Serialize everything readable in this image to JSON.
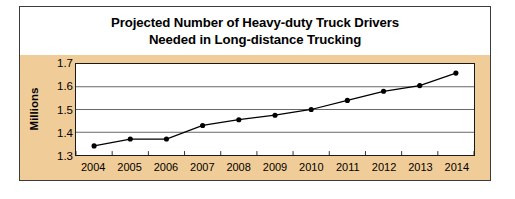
{
  "figure": {
    "title_lines": [
      "Projected Number of Heavy-duty Truck Drivers",
      "Needed in Long-distance Trucking"
    ],
    "background_color": "#f0cd98",
    "plot_background_color": "#ffffff",
    "border_color": "#3b3b3b",
    "line_color": "#000000",
    "marker_color": "#000000",
    "gridline_color": "#555555"
  },
  "chart_data": {
    "type": "line",
    "title": "Projected Number of Heavy-duty Truck Drivers Needed in Long-distance Trucking",
    "xlabel": "",
    "ylabel": "Millions",
    "categories": [
      "2004",
      "2005",
      "2006",
      "2007",
      "2008",
      "2009",
      "2010",
      "2011",
      "2012",
      "2013",
      "2014"
    ],
    "values": [
      1.34,
      1.37,
      1.37,
      1.43,
      1.455,
      1.475,
      1.5,
      1.54,
      1.58,
      1.605,
      1.66
    ],
    "ylim": [
      1.3,
      1.7
    ],
    "yticks": [
      1.3,
      1.4,
      1.5,
      1.6,
      1.7
    ],
    "ytick_labels": [
      "1.3",
      "1.4",
      "1.5",
      "1.6",
      "1.7"
    ],
    "grid": true,
    "grid_axis": "y",
    "legend": false,
    "markers": "filled-circle",
    "series": [
      {
        "name": "Projected heavy-duty truck drivers needed",
        "values": [
          1.34,
          1.37,
          1.37,
          1.43,
          1.455,
          1.475,
          1.5,
          1.54,
          1.58,
          1.605,
          1.66
        ]
      }
    ]
  }
}
